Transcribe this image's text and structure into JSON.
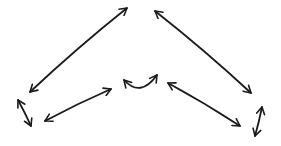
{
  "diagram": {
    "style": "hand-drawn",
    "background": "#ffffff",
    "ink_color": "#1a1a1a",
    "arrows": [
      {
        "id": "left-long",
        "type": "double",
        "from": [
          30,
          92
        ],
        "to": [
          127,
          8
        ]
      },
      {
        "id": "right-long",
        "type": "double",
        "from": [
          155,
          11
        ],
        "to": [
          251,
          93
        ]
      },
      {
        "id": "left-short-tick",
        "type": "double",
        "from": [
          18,
          100
        ],
        "to": [
          31,
          126
        ]
      },
      {
        "id": "left-mid",
        "type": "double",
        "from": [
          45,
          121
        ],
        "to": [
          111,
          89
        ]
      },
      {
        "id": "center-curve",
        "type": "double-curved",
        "from": [
          124,
          80
        ],
        "to": [
          157,
          75
        ]
      },
      {
        "id": "right-mid",
        "type": "double",
        "from": [
          168,
          83
        ],
        "to": [
          240,
          126
        ]
      },
      {
        "id": "right-short-tick",
        "type": "double",
        "from": [
          262,
          107
        ],
        "to": [
          255,
          136
        ]
      }
    ]
  }
}
